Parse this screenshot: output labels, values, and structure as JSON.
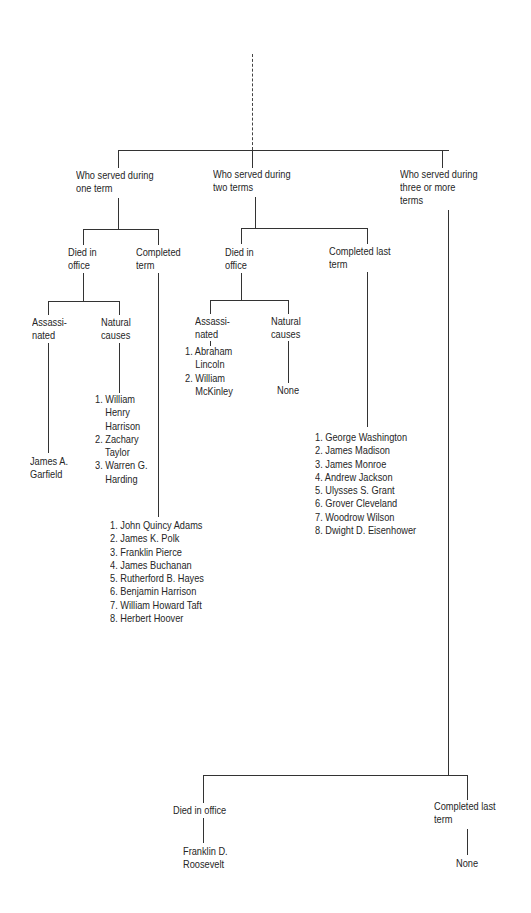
{
  "diagram": {
    "root_connector": "dashed-line",
    "branches": {
      "one_term": {
        "label": "Who served during\none term",
        "died_in_office": {
          "label": "Died in\noffice",
          "assassinated": {
            "label": "Assassi-\nnated",
            "names": [
              "James A.\nGarfield"
            ]
          },
          "natural_causes": {
            "label": "Natural\ncauses",
            "names": [
              "1. William\n    Henry\n    Harrison",
              "2. Zachary\n    Taylor",
              "3. Warren G.\n    Harding"
            ]
          }
        },
        "completed_term": {
          "label": "Completed\nterm",
          "names": [
            "1. John Quincy Adams",
            "2. James K. Polk",
            "3. Franklin Pierce",
            "4. James Buchanan",
            "5. Rutherford B. Hayes",
            "6. Benjamin Harrison",
            "7. William Howard Taft",
            "8. Herbert Hoover"
          ]
        }
      },
      "two_terms": {
        "label": "Who served during\ntwo terms",
        "died_in_office": {
          "label": "Died in\noffice",
          "assassinated": {
            "label": "Assassi-\nnated",
            "names": [
              "1. Abraham\n    Lincoln",
              "2. William\n    McKinley"
            ]
          },
          "natural_causes": {
            "label": "Natural\ncauses",
            "names": [
              "None"
            ]
          }
        },
        "completed_last_term": {
          "label": "Completed last\nterm",
          "names": [
            "1. George Washington",
            "2. James Madison",
            "3. James Monroe",
            "4. Andrew Jackson",
            "5. Ulysses S. Grant",
            "6. Grover Cleveland",
            "7. Woodrow Wilson",
            "8. Dwight D. Eisenhower"
          ]
        }
      },
      "three_or_more": {
        "label": "Who served during\nthree or more\nterms",
        "died_in_office": {
          "label": "Died in office",
          "names": [
            "Franklin D.\nRoosevelt"
          ]
        },
        "completed_last_term": {
          "label": "Completed last\nterm",
          "names": [
            "None"
          ]
        }
      }
    }
  }
}
